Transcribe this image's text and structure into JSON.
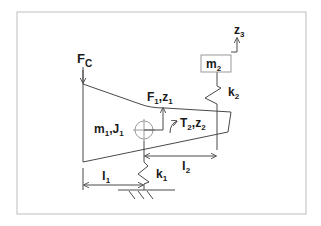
{
  "diagram": {
    "type": "mechanical-model",
    "frame": {
      "x": 17,
      "y": 12,
      "width": 289,
      "height": 202,
      "stroke": "#bdbdbd"
    },
    "colors": {
      "line": "#4a4a4a",
      "text": "#1a1a1a",
      "frame": "#bdbdbd",
      "crosshair": "#9a9a9a"
    },
    "labels": {
      "force_c": {
        "main": "F",
        "sub": "C"
      },
      "force_1": {
        "main": "F",
        "sub": "1",
        "sep": ",",
        "main2": "z",
        "sub2": "1"
      },
      "body_1": {
        "main": "m",
        "sub": "1",
        "sep": ",",
        "main2": "J",
        "sub2": "1"
      },
      "torque_2": {
        "main": "T",
        "sub": "2",
        "sep": ",",
        "main2": "z",
        "sub2": "2"
      },
      "mass_2": {
        "main": "m",
        "sub": "2"
      },
      "spring_2": {
        "main": "k",
        "sub": "2"
      },
      "disp_3": {
        "main": "z",
        "sub": "3"
      },
      "spring_1": {
        "main": "k",
        "sub": "1"
      },
      "length_1": {
        "main": "l",
        "sub": "1"
      },
      "length_2": {
        "main": "l",
        "sub": "2"
      }
    }
  }
}
